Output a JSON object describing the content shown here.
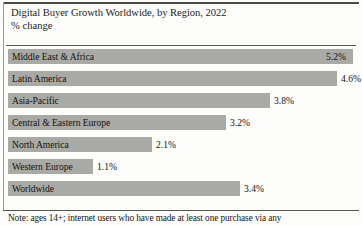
{
  "chart_data": {
    "type": "bar",
    "orientation": "horizontal",
    "title": "Digital Buyer Growth Worldwide, by Region, 2022",
    "subtitle": "% change",
    "xlabel": "",
    "ylabel": "",
    "grid": false,
    "legend": false,
    "axis_max": 5.2,
    "categories": [
      "Middle East & Africa",
      "Latin America",
      "Asia-Pacific",
      "Central & Eastern Europe",
      "North America",
      "Western Europe",
      "Worldwide"
    ],
    "values": [
      5.2,
      4.6,
      3.8,
      3.2,
      2.1,
      1.1,
      3.4
    ],
    "value_labels": [
      "5.2%",
      "4.6%",
      "3.8%",
      "3.2%",
      "2.1%",
      "1.1%",
      "3.4%"
    ],
    "bar_color": "#a9a9a6",
    "note": "Note: ages 14+; internet users who have made at least one purchase via any"
  },
  "rows": [
    {
      "label": "Middle East & Africa",
      "value_label": "5.2%",
      "bar_width": 345,
      "label_inside": true
    },
    {
      "label": "Latin America",
      "value_label": "4.6%",
      "bar_width": 329,
      "label_inside": false
    },
    {
      "label": "Asia-Pacific",
      "value_label": "3.8%",
      "bar_width": 262,
      "label_inside": false
    },
    {
      "label": "Central & Eastern Europe",
      "value_label": "3.2%",
      "bar_width": 218,
      "label_inside": false
    },
    {
      "label": "North America",
      "value_label": "2.1%",
      "bar_width": 144,
      "label_inside": false
    },
    {
      "label": "Western Europe",
      "value_label": "1.1%",
      "bar_width": 85,
      "label_inside": false
    },
    {
      "label": "Worldwide",
      "value_label": "3.4%",
      "bar_width": 232,
      "label_inside": false
    }
  ]
}
